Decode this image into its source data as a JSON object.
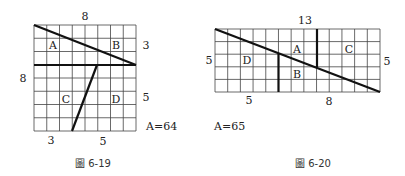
{
  "figures": [
    {
      "id": "fig-6-19",
      "caption": "圖 6-19",
      "grid": {
        "cols": 8,
        "rows": 8
      },
      "top_label": "8",
      "left_label": "8",
      "right_labels": [
        "3",
        "5"
      ],
      "bottom_labels": [
        "3",
        "5"
      ],
      "pieces": [
        "A",
        "B",
        "C",
        "D"
      ],
      "area_label": "A=64"
    },
    {
      "id": "fig-6-20",
      "caption": "圖 6-20",
      "grid": {
        "cols": 13,
        "rows": 5
      },
      "top_label": "13",
      "left_label": "5",
      "right_label": "5",
      "bottom_labels": [
        "5",
        "8"
      ],
      "pieces": [
        "A",
        "B",
        "C",
        "D"
      ],
      "area_label": "A=65"
    }
  ]
}
